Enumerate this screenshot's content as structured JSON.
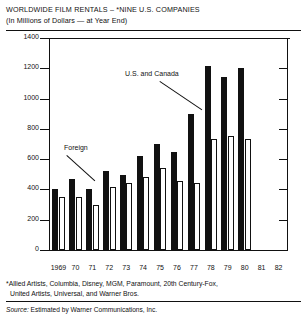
{
  "header": {
    "title": "WORLDWIDE FILM RENTALS – *NINE U.S. COMPANIES",
    "subtitle": "(In Millions of Dollars — at Year End)"
  },
  "annotations": {
    "domestic_label": "U.S. and Canada",
    "foreign_label": "Foreign"
  },
  "footnotes": {
    "line1": "*Allied Artists, Columbia, Disney, MGM, Paramount, 20th Century-Fox,",
    "line2": "United Artists, Universal, and Warner Bros.",
    "source_prefix": "Source:",
    "source_text": "Estimated by Warner Communications, Inc."
  },
  "colors": {
    "domestic": "#111111",
    "foreign": "#ffffff",
    "outline": "#111111",
    "background": "#ffffff"
  },
  "chart_data": {
    "type": "bar",
    "title": "WORLDWIDE FILM RENTALS – *NINE U.S. COMPANIES",
    "subtitle": "(In Millions of Dollars — at Year End)",
    "xlabel": "",
    "ylabel": "",
    "ylim": [
      0,
      1400
    ],
    "yticks": [
      0,
      200,
      400,
      600,
      800,
      1000,
      1200,
      1400
    ],
    "ytick_labels": [
      "0",
      "200",
      "400",
      "600",
      "800",
      "1000",
      "1200",
      "1400"
    ],
    "grid": false,
    "legend": "annotated inline",
    "categories": [
      "1969",
      "70",
      "71",
      "72",
      "73",
      "74",
      "75",
      "76",
      "77",
      "78",
      "79",
      "80",
      "81",
      "82"
    ],
    "series": [
      {
        "name": "U.S. and Canada",
        "style": "solid-black",
        "values": [
          400,
          470,
          405,
          520,
          495,
          620,
          700,
          650,
          900,
          1215,
          1145,
          1205,
          null,
          null
        ]
      },
      {
        "name": "Foreign",
        "style": "open-white",
        "values": [
          350,
          350,
          300,
          415,
          440,
          480,
          540,
          455,
          440,
          735,
          755,
          735,
          null,
          null
        ]
      }
    ]
  },
  "axis": {
    "x_labels": [
      "1969",
      "70",
      "71",
      "72",
      "73",
      "74",
      "75",
      "76",
      "77",
      "78",
      "79",
      "80",
      "81",
      "82"
    ],
    "y_labels": [
      "1400",
      "1200",
      "1000",
      "800",
      "600",
      "400",
      "200",
      "0"
    ]
  }
}
